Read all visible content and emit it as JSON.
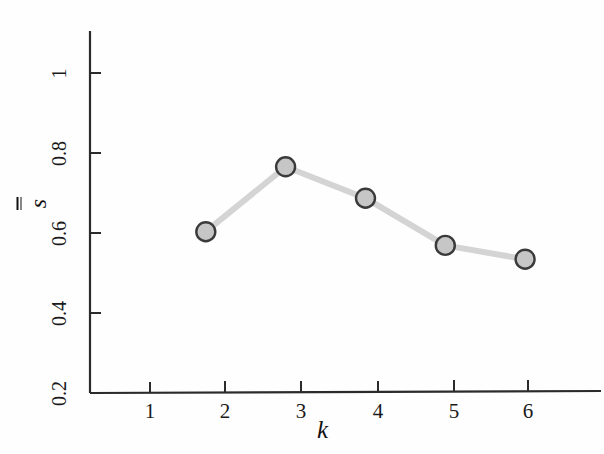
{
  "chart_data": {
    "type": "line",
    "title": "",
    "subtitle": "",
    "xlabel": "k",
    "ylabel": "s",
    "ylabel_notation": "s-double-bar",
    "x": [
      2,
      3,
      4,
      5,
      6
    ],
    "values": [
      0.61,
      0.775,
      0.695,
      0.575,
      0.54
    ],
    "series": [
      {
        "name": "s-double-bar",
        "x": [
          2,
          3,
          4,
          5,
          6
        ],
        "values": [
          0.61,
          0.775,
          0.695,
          0.575,
          0.54
        ]
      }
    ],
    "xlim": [
      0.55,
      6.95
    ],
    "ylim": [
      0.2,
      1.12
    ],
    "xticks": [
      "1",
      "2",
      "3",
      "4",
      "5",
      "6"
    ],
    "xtick_values": [
      1,
      2,
      3,
      4,
      5,
      6
    ],
    "yticks": [
      "0.2",
      "0.4",
      "0.6",
      "0.8",
      "1"
    ],
    "ytick_values": [
      0.2,
      0.4,
      0.6,
      0.8,
      1.0
    ],
    "grid": false,
    "legend": null,
    "legend_position": "none",
    "marker": "circle",
    "marker_face_color": "#c6c6c6",
    "marker_edge_color": "#3a3a3a",
    "line_color": "#d4d4d4",
    "axis_color": "#2b2b2b"
  },
  "axes": {
    "x_title": "k",
    "y_title": "s"
  }
}
